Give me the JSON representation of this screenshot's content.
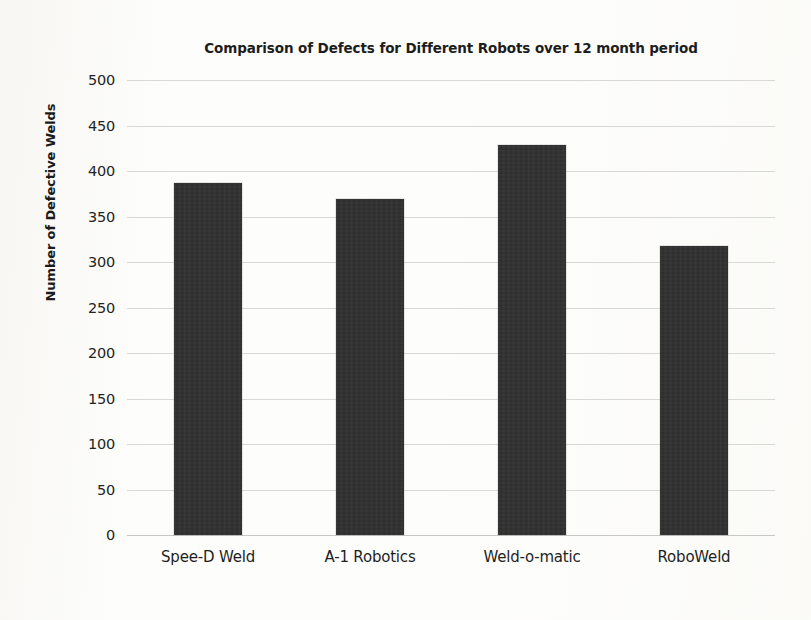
{
  "chart_data": {
    "type": "bar",
    "title": "Comparison of Defects for Different Robots over 12 month period",
    "xlabel": "",
    "ylabel": "Number of Defective Welds",
    "categories": [
      "Spee-D Weld",
      "A-1 Robotics",
      "Weld-o-matic",
      "RoboWeld"
    ],
    "values": [
      387,
      369,
      429,
      318
    ],
    "ylim": [
      0,
      500
    ],
    "ytick_step": 50,
    "ytick_labels": [
      "500",
      "450",
      "400",
      "350",
      "300",
      "250",
      "200",
      "150",
      "100",
      "50",
      "0"
    ],
    "grid": true,
    "legend": "none",
    "series": [
      {
        "name": "Number of Defective Welds",
        "values": [
          387,
          369,
          429,
          318
        ],
        "color": "#2c2c2c"
      }
    ],
    "colors": {
      "bar": "#2c2c2c",
      "gridline": "#d8d8d4",
      "text": "#1f1f1f",
      "background": "#fdfdfb"
    }
  }
}
